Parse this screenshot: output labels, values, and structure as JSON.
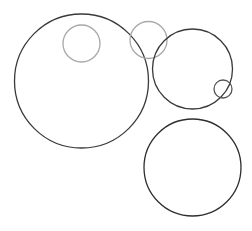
{
  "canvas": {
    "width": 252,
    "height": 231,
    "background": "#ffffff"
  },
  "colors": {
    "dark_stroke": "#3a3a3a",
    "light_stroke": "#a8a8a8"
  },
  "circles": [
    {
      "id": "large-left",
      "cx": 81.5,
      "cy": 81,
      "r": 67,
      "stroke": "#3a3a3a",
      "width": 1.3
    },
    {
      "id": "small-inside-large",
      "cx": 81.5,
      "cy": 43.5,
      "r": 18.5,
      "stroke": "#a8a8a8",
      "width": 1.3
    },
    {
      "id": "top-middle-gray",
      "cx": 148.5,
      "cy": 40,
      "r": 18.5,
      "stroke": "#a8a8a8",
      "width": 1.3
    },
    {
      "id": "right-middle",
      "cx": 192.5,
      "cy": 69,
      "r": 40,
      "stroke": "#3a3a3a",
      "width": 1.3
    },
    {
      "id": "tiny-right",
      "cx": 223,
      "cy": 89,
      "r": 9,
      "stroke": "#555555",
      "width": 1.3
    },
    {
      "id": "bottom-right",
      "cx": 192.5,
      "cy": 167.5,
      "r": 48.5,
      "stroke": "#2e2e2e",
      "width": 1.3
    }
  ]
}
